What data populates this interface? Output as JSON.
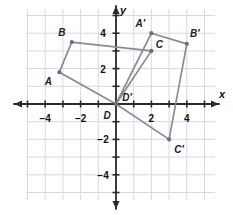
{
  "figure": {
    "axis": {
      "x_label": "x",
      "y_label": "y",
      "x_ticks": [
        -4,
        -2,
        2,
        4
      ],
      "y_ticks": [
        4,
        2,
        -2,
        -4
      ],
      "x_tick_labels": [
        "−4",
        "−2",
        "2",
        "4"
      ],
      "y_tick_labels": [
        "4",
        "2",
        "−2",
        "−4"
      ],
      "xlim": [
        -5.1,
        5.2
      ],
      "ylim": [
        -5.4,
        5.4
      ],
      "grid": true
    },
    "colors": {
      "grid": "#d8d8e2",
      "axis": "#2b2b2b",
      "shape": "#8a8a96",
      "vertex": "#6f6f7c",
      "background": "#ffffff"
    },
    "shapes": [
      {
        "name": "ABCD",
        "vertices": [
          {
            "label": "A",
            "x": -3.2,
            "y": 1.8,
            "label_dx": -11,
            "label_dy": 9
          },
          {
            "label": "B",
            "x": -2.5,
            "y": 3.5,
            "label_dx": -10,
            "label_dy": -10
          },
          {
            "label": "C",
            "x": 2.0,
            "y": 3.0,
            "label_dx": 8,
            "label_dy": -7
          },
          {
            "label": "D",
            "x": 0.0,
            "y": 0.0,
            "label_dx": -9,
            "label_dy": 11
          }
        ],
        "closed": true
      },
      {
        "name": "A'B'C'D'",
        "vertices": [
          {
            "label": "A′",
            "x": 2.0,
            "y": 4.0,
            "label_dx": -11,
            "label_dy": -10
          },
          {
            "label": "B′",
            "x": 4.0,
            "y": 3.4,
            "label_dx": 8,
            "label_dy": -11
          },
          {
            "label": "C′",
            "x": 3.0,
            "y": -2.0,
            "label_dx": 10,
            "label_dy": 10
          },
          {
            "label": "D′",
            "x": 0.0,
            "y": 0.0,
            "label_dx": 11,
            "label_dy": -7
          }
        ],
        "closed": true
      }
    ]
  }
}
